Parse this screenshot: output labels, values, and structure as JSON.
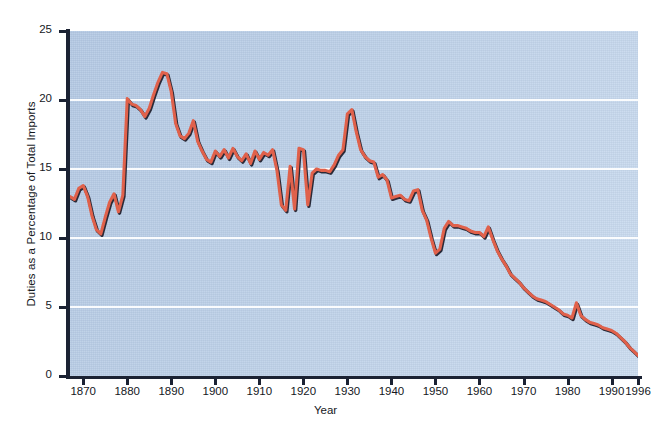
{
  "figure": {
    "background_color": "#ffffff",
    "plot_background_color": "#bcd0e8",
    "gridline_color": "#ffffff",
    "axis_color": "#1b2233"
  },
  "chart_data": {
    "type": "line",
    "title": "",
    "xlabel": "Year",
    "ylabel": "Duties as a Percentage of Total Imports",
    "xlim": [
      1867,
      1996
    ],
    "ylim": [
      0,
      25
    ],
    "grid": true,
    "legend": "none",
    "line_color": "#e0614b",
    "shadow_color": "#2a2a38",
    "y_ticks": [
      0,
      5,
      10,
      15,
      20,
      25
    ],
    "y_tick_labels": [
      "0",
      "5",
      "10",
      "15",
      "20",
      "25"
    ],
    "x_ticks": [
      1870,
      1880,
      1890,
      1900,
      1910,
      1920,
      1930,
      1940,
      1950,
      1960,
      1970,
      1980,
      1990,
      1996
    ],
    "x_tick_labels": [
      "1870",
      "1880",
      "1890",
      "1900",
      "1910",
      "1920",
      "1930",
      "1940",
      "1950",
      "1960",
      "1970",
      "1980",
      "1990",
      "1996"
    ],
    "series": [
      {
        "name": "Duties as a Percentage of Total Imports",
        "x": [
          1867,
          1868,
          1869,
          1870,
          1871,
          1872,
          1873,
          1874,
          1875,
          1876,
          1877,
          1878,
          1879,
          1880,
          1881,
          1882,
          1883,
          1884,
          1885,
          1886,
          1887,
          1888,
          1889,
          1890,
          1891,
          1892,
          1893,
          1894,
          1895,
          1896,
          1897,
          1898,
          1899,
          1900,
          1901,
          1902,
          1903,
          1904,
          1905,
          1906,
          1907,
          1908,
          1909,
          1910,
          1911,
          1912,
          1913,
          1914,
          1915,
          1916,
          1917,
          1918,
          1919,
          1920,
          1921,
          1922,
          1923,
          1924,
          1925,
          1926,
          1927,
          1928,
          1929,
          1930,
          1931,
          1932,
          1933,
          1934,
          1935,
          1936,
          1937,
          1938,
          1939,
          1940,
          1941,
          1942,
          1943,
          1944,
          1945,
          1946,
          1947,
          1948,
          1949,
          1950,
          1951,
          1952,
          1953,
          1954,
          1955,
          1956,
          1957,
          1958,
          1959,
          1960,
          1961,
          1962,
          1963,
          1964,
          1965,
          1966,
          1967,
          1968,
          1969,
          1970,
          1971,
          1972,
          1973,
          1974,
          1975,
          1976,
          1977,
          1978,
          1979,
          1980,
          1981,
          1982,
          1983,
          1984,
          1985,
          1986,
          1987,
          1988,
          1989,
          1990,
          1991,
          1992,
          1993,
          1994,
          1995,
          1996
        ],
        "y": [
          13.0,
          12.8,
          13.6,
          13.8,
          13.0,
          11.6,
          10.6,
          10.3,
          11.5,
          12.6,
          13.2,
          11.9,
          13.1,
          20.1,
          19.7,
          19.6,
          19.3,
          18.8,
          19.4,
          20.4,
          21.3,
          22.0,
          21.9,
          20.6,
          18.3,
          17.4,
          17.2,
          17.6,
          18.5,
          17.0,
          16.3,
          15.7,
          15.5,
          16.3,
          15.9,
          16.4,
          15.8,
          16.5,
          15.9,
          15.6,
          16.1,
          15.4,
          16.3,
          15.7,
          16.2,
          16.0,
          16.4,
          14.9,
          12.4,
          12.0,
          15.2,
          12.1,
          16.5,
          16.4,
          12.4,
          14.7,
          15.0,
          14.9,
          14.9,
          14.8,
          15.3,
          16.0,
          16.4,
          19.0,
          19.3,
          17.7,
          16.4,
          15.9,
          15.6,
          15.5,
          14.4,
          14.6,
          14.2,
          12.9,
          13.0,
          13.1,
          12.8,
          12.7,
          13.4,
          13.5,
          12.0,
          11.3,
          10.0,
          8.9,
          9.2,
          10.7,
          11.2,
          10.9,
          10.9,
          10.8,
          10.7,
          10.5,
          10.4,
          10.4,
          10.1,
          10.8,
          9.9,
          9.1,
          8.5,
          8.0,
          7.4,
          7.1,
          6.8,
          6.4,
          6.1,
          5.8,
          5.6,
          5.5,
          5.4,
          5.2,
          5.0,
          4.8,
          4.5,
          4.4,
          4.2,
          5.3,
          4.4,
          4.1,
          3.9,
          3.8,
          3.7,
          3.5,
          3.4,
          3.3,
          3.1,
          2.8,
          2.5,
          2.1,
          1.8,
          1.5
        ]
      }
    ]
  }
}
